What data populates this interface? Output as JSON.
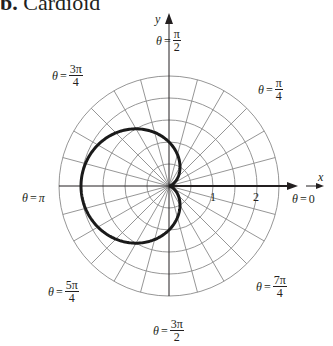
{
  "title": {
    "prefix": "b.",
    "text": "Cardioid"
  },
  "axes": {
    "x_label": "x",
    "y_label": "y"
  },
  "angle_labels": [
    {
      "id": "theta-0",
      "theta": "θ",
      "eq": "=",
      "value": "0"
    },
    {
      "id": "theta-pi-over-4",
      "theta": "θ",
      "eq": "=",
      "num": "π",
      "den": "4"
    },
    {
      "id": "theta-pi-over-2",
      "theta": "θ",
      "eq": "=",
      "num": "π",
      "den": "2"
    },
    {
      "id": "theta-3pi-over-4",
      "theta": "θ",
      "eq": "=",
      "num": "3π",
      "den": "4"
    },
    {
      "id": "theta-pi",
      "theta": "θ",
      "eq": "=",
      "value": "π"
    },
    {
      "id": "theta-5pi-over-4",
      "theta": "θ",
      "eq": "=",
      "num": "5π",
      "den": "4"
    },
    {
      "id": "theta-3pi-over-2",
      "theta": "θ",
      "eq": "=",
      "num": "3π",
      "den": "2"
    },
    {
      "id": "theta-7pi-over-4",
      "theta": "θ",
      "eq": "=",
      "num": "7π",
      "den": "4"
    }
  ],
  "radial_ticks": [
    "1",
    "2"
  ],
  "chart_data": {
    "type": "line",
    "coordinate_system": "polar",
    "title": "Cardioid",
    "equation": "r = 1 - cos θ",
    "series": [
      {
        "name": "cardioid",
        "theta_deg": [
          0,
          30,
          60,
          90,
          120,
          150,
          180,
          210,
          240,
          270,
          300,
          330,
          360
        ],
        "r": [
          0,
          0.134,
          0.5,
          1,
          1.5,
          1.866,
          2,
          1.866,
          1.5,
          1,
          0.5,
          0.134,
          0
        ]
      }
    ],
    "grid": {
      "circles_r": [
        0.5,
        1,
        1.5,
        2,
        2.5
      ],
      "radial_lines_every_deg": 15
    },
    "rlim": [
      0,
      2.5
    ],
    "tick_labels": {
      "r": [
        "1",
        "2"
      ]
    },
    "angle_labels": [
      "θ = 0",
      "θ = π/4",
      "θ = π/2",
      "θ = 3π/4",
      "θ = π",
      "θ = 5π/4",
      "θ = 3π/2",
      "θ = 7π/4"
    ],
    "xlabel": "x",
    "ylabel": "y",
    "colors": {
      "grid": "#8a8a8a",
      "curve": "#1a1a1a",
      "axis": "#231f20"
    }
  }
}
